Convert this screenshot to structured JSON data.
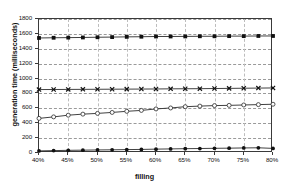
{
  "chart_data": {
    "type": "line",
    "title": "",
    "xlabel": "filling",
    "ylabel": "generation time (milliseconds)",
    "xlim": [
      40,
      80
    ],
    "ylim": [
      0,
      1800
    ],
    "grid": true,
    "legend": "none",
    "x_tick_labels": [
      "40%",
      "45%",
      "50%",
      "55%",
      "60%",
      "65%",
      "70%",
      "75%",
      "80%"
    ],
    "x_tick_values": [
      40,
      45,
      50,
      55,
      60,
      65,
      70,
      75,
      80
    ],
    "y_tick_labels": [
      "0",
      "200",
      "400",
      "600",
      "800",
      "1000",
      "1200",
      "1400",
      "1600",
      "1800"
    ],
    "y_tick_values": [
      0,
      200,
      400,
      600,
      800,
      1000,
      1200,
      1400,
      1600,
      1800
    ],
    "x": [
      40,
      42.5,
      45,
      47.5,
      50,
      52.5,
      55,
      57.5,
      60,
      62.5,
      65,
      67.5,
      70,
      72.5,
      75,
      77.5,
      80
    ],
    "series": [
      {
        "name": "series-1",
        "marker": "filled-square",
        "values": [
          1545,
          1548,
          1550,
          1552,
          1555,
          1557,
          1560,
          1562,
          1565,
          1565,
          1566,
          1568,
          1568,
          1570,
          1570,
          1572,
          1572
        ]
      },
      {
        "name": "series-2",
        "marker": "cross",
        "values": [
          852,
          853,
          854,
          855,
          856,
          857,
          858,
          859,
          860,
          862,
          863,
          864,
          866,
          868,
          870,
          872,
          874
        ]
      },
      {
        "name": "series-3",
        "marker": "open-circle",
        "values": [
          465,
          485,
          508,
          522,
          532,
          545,
          560,
          572,
          592,
          605,
          622,
          630,
          637,
          640,
          645,
          650,
          655
        ]
      },
      {
        "name": "series-4",
        "marker": "filled-circle",
        "values": [
          28,
          32,
          36,
          38,
          41,
          43,
          46,
          48,
          52,
          55,
          58,
          60,
          63,
          65,
          68,
          70,
          62
        ]
      }
    ]
  }
}
